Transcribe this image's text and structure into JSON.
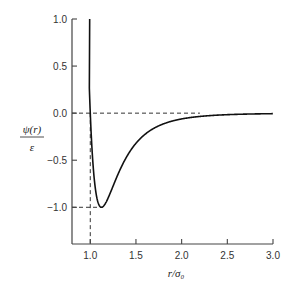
{
  "chart_data": {
    "type": "line",
    "title": "",
    "xlabel": "r/σ₀",
    "ylabel": "ψ(r)/ε",
    "ylabel_num": "ψ(r)",
    "ylabel_den": "ε",
    "xlim": [
      0.8,
      3.0
    ],
    "ylim": [
      -1.39,
      1.0
    ],
    "x_ticks": [
      1.0,
      1.5,
      2.0,
      2.5,
      3.0
    ],
    "x_tick_labels": [
      "1.0",
      "1.5",
      "2.0",
      "2.5",
      "3.0"
    ],
    "y_ticks": [
      1.0,
      0.5,
      0.0,
      -0.5,
      -1.0
    ],
    "y_tick_labels": [
      "1.0",
      "0.5",
      "0.0",
      "−0.5",
      "−1.0"
    ],
    "grid": false,
    "legend": null,
    "series": [
      {
        "name": "Lennard-Jones potential",
        "x": [
          1.0,
          1.02,
          1.05,
          1.08,
          1.12,
          1.15,
          1.2,
          1.3,
          1.4,
          1.5,
          1.6,
          1.8,
          2.0,
          2.2,
          2.5,
          3.0
        ],
        "values": [
          0.0,
          -0.42,
          -0.78,
          -0.94,
          -1.0,
          -0.98,
          -0.9,
          -0.69,
          -0.5,
          -0.36,
          -0.26,
          -0.13,
          -0.06,
          -0.02,
          -0.01,
          0.0
        ]
      }
    ],
    "annotations": [
      {
        "type": "hline-dashed",
        "y": 0.0,
        "from_x": 0.8,
        "to_x": 2.2
      },
      {
        "type": "vline-dashed",
        "x": 1.0,
        "from_y": -1.39,
        "to_y": 0.0
      },
      {
        "type": "hline-dashed",
        "y": -1.0,
        "from_x": 0.8,
        "to_x": 1.12
      }
    ]
  }
}
